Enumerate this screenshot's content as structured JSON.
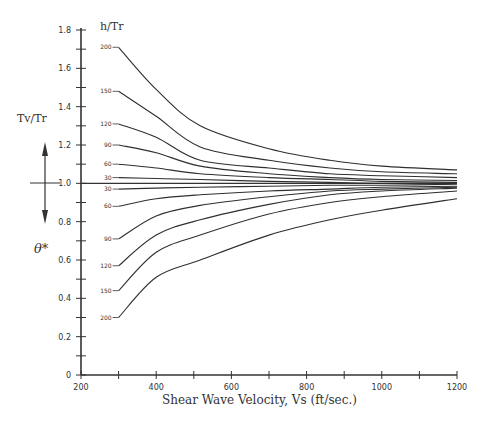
{
  "chart_data": {
    "type": "line",
    "title": "",
    "xlabel": "Shear Wave Velocity, Vs (ft/sec.)",
    "ylabel": "Tv/Tr",
    "ylabel_secondary": "θ*",
    "legend_title": "h/Tr",
    "xlim": [
      200,
      1200
    ],
    "ylim": [
      0,
      1.8
    ],
    "grid": false,
    "x_ticks": [
      200,
      300,
      400,
      500,
      600,
      700,
      800,
      900,
      1000,
      1100,
      1200
    ],
    "x_tick_labels": [
      "200",
      "400",
      "600",
      "800",
      "1000",
      "1200"
    ],
    "y_ticks": [
      0,
      0.1,
      0.2,
      0.3,
      0.4,
      0.5,
      0.6,
      0.7,
      0.8,
      0.9,
      1.0,
      1.1,
      1.2,
      1.3,
      1.4,
      1.5,
      1.6,
      1.7,
      1.8
    ],
    "y_tick_labels": [
      "0",
      "0.2",
      "0.4",
      "0.6",
      "0.8",
      "1.0",
      "1.2",
      "1.4",
      "1.6",
      "1.8"
    ],
    "x": [
      300,
      400,
      517,
      700,
      862,
      1000,
      1200
    ],
    "series": [
      {
        "name": "200 (Tv/Tr)",
        "label": "200",
        "group": "upper",
        "values": [
          1.71,
          1.49,
          1.3,
          1.18,
          1.12,
          1.09,
          1.07
        ]
      },
      {
        "name": "150 (Tv/Tr)",
        "label": "150",
        "group": "upper",
        "values": [
          1.48,
          1.35,
          1.19,
          1.12,
          1.08,
          1.06,
          1.05
        ]
      },
      {
        "name": "120 (Tv/Tr)",
        "label": "120",
        "group": "upper",
        "values": [
          1.31,
          1.24,
          1.12,
          1.08,
          1.05,
          1.04,
          1.03
        ]
      },
      {
        "name": "90 (Tv/Tr)",
        "label": "90",
        "group": "upper",
        "values": [
          1.2,
          1.16,
          1.09,
          1.05,
          1.03,
          1.02,
          1.015
        ]
      },
      {
        "name": "60 (Tv/Tr)",
        "label": "60",
        "group": "upper",
        "values": [
          1.1,
          1.08,
          1.05,
          1.03,
          1.02,
          1.01,
          1.005
        ]
      },
      {
        "name": "30 (Tv/Tr)",
        "label": "30",
        "group": "upper",
        "values": [
          1.03,
          1.025,
          1.02,
          1.01,
          1.005,
          1.0,
          1.0
        ]
      },
      {
        "name": "30 (θ*)",
        "label": "30",
        "group": "lower",
        "values": [
          0.97,
          0.975,
          0.98,
          0.985,
          0.99,
          0.99,
          0.995
        ]
      },
      {
        "name": "60 (θ*)",
        "label": "60",
        "group": "lower",
        "values": [
          0.88,
          0.92,
          0.94,
          0.96,
          0.97,
          0.98,
          0.985
        ]
      },
      {
        "name": "90 (θ*)",
        "label": "90",
        "group": "lower",
        "values": [
          0.71,
          0.83,
          0.885,
          0.93,
          0.96,
          0.97,
          0.98
        ]
      },
      {
        "name": "120 (θ*)",
        "label": "120",
        "group": "lower",
        "values": [
          0.57,
          0.73,
          0.81,
          0.89,
          0.94,
          0.96,
          0.975
        ]
      },
      {
        "name": "150 (θ*)",
        "label": "150",
        "group": "lower",
        "values": [
          0.44,
          0.64,
          0.73,
          0.84,
          0.9,
          0.93,
          0.96
        ]
      },
      {
        "name": "200 (θ*)",
        "label": "200",
        "group": "lower",
        "values": [
          0.3,
          0.51,
          0.6,
          0.73,
          0.81,
          0.86,
          0.92
        ]
      }
    ],
    "annotations": [
      "h/Tr",
      "Tv/Tr",
      "θ*",
      "double-headed arrow at 1.0 (up: Tv/Tr, down: θ*)"
    ]
  },
  "labels": {
    "xlabel": "Shear Wave Velocity, Vs (ft/sec.)",
    "legend_title": "h/Tr",
    "ylabel_top": "Tv/Tr",
    "ylabel_bottom": "θ*"
  }
}
